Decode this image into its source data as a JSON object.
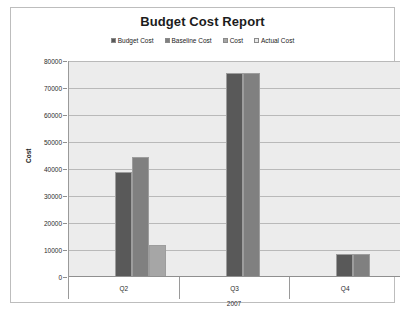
{
  "chart_data": {
    "type": "bar",
    "title": "Budget Cost Report",
    "xlabel": "2007",
    "ylabel": "Cost",
    "categories": [
      "Q2",
      "Q3",
      "Q4"
    ],
    "ylim": [
      0,
      80000
    ],
    "ytick_values": [
      80000,
      70000,
      60000,
      50000,
      40000,
      30000,
      20000,
      10000,
      0
    ],
    "ytick_labels": [
      "80000",
      "70000",
      "60000",
      "50000",
      "40000",
      "30000",
      "20000",
      "10000",
      "0"
    ],
    "grid": true,
    "legend_position": "top-center",
    "series": [
      {
        "name": "Budget Cost",
        "color": "#595959",
        "values": [
          39000,
          75500,
          8500
        ]
      },
      {
        "name": "Baseline Cost",
        "color": "#808080",
        "values": [
          44500,
          75500,
          8500
        ]
      },
      {
        "name": "Cost",
        "color": "#a6a6a6",
        "values": [
          12000,
          null,
          null
        ]
      },
      {
        "name": "Actual Cost",
        "color": "#e8e8e8",
        "values": [
          null,
          null,
          null
        ]
      }
    ]
  },
  "plot": {
    "background": "#ececec",
    "gridline_color": "#b9b9b9",
    "frame_color": "#bdbdbd"
  }
}
